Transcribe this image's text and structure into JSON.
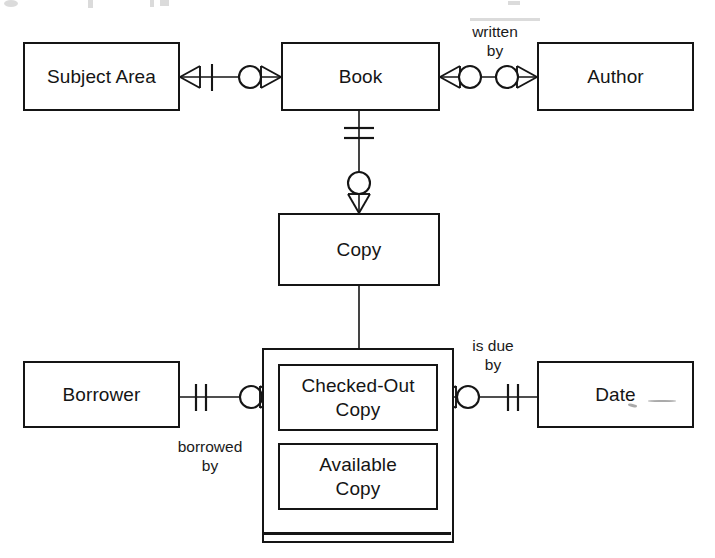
{
  "diagram": {
    "notation": "crow's-foot",
    "background_color": "#ffffff",
    "line_color": "#151515",
    "entities": [
      {
        "id": "subject-area",
        "label": "Subject Area",
        "x": 23,
        "y": 42,
        "w": 157,
        "h": 69
      },
      {
        "id": "book",
        "label": "Book",
        "x": 281,
        "y": 42,
        "w": 159,
        "h": 69
      },
      {
        "id": "author",
        "label": "Author",
        "x": 537,
        "y": 42,
        "w": 157,
        "h": 69
      },
      {
        "id": "copy",
        "label": "Copy",
        "x": 278,
        "y": 213,
        "w": 162,
        "h": 73
      },
      {
        "id": "borrower",
        "label": "Borrower",
        "x": 23,
        "y": 361,
        "w": 157,
        "h": 67
      },
      {
        "id": "date",
        "label": "Date",
        "x": 537,
        "y": 361,
        "w": 157,
        "h": 67
      },
      {
        "id": "checked-out-copy",
        "label": "Checked-Out\nCopy",
        "x": 278,
        "y": 364,
        "w": 160,
        "h": 67
      },
      {
        "id": "available-copy",
        "label": "Available\nCopy",
        "x": 278,
        "y": 443,
        "w": 160,
        "h": 67
      }
    ],
    "supertype_container": {
      "id": "copy-subtype-container",
      "x": 262,
      "y": 348,
      "w": 192,
      "h": 195,
      "subtypes": [
        "checked-out-copy",
        "available-copy"
      ]
    },
    "relationships": [
      {
        "id": "subject-area-book",
        "label": "",
        "from": "subject-area",
        "to": "book",
        "from_cardinality": "many-one",
        "to_cardinality": "zero-many"
      },
      {
        "id": "book-author",
        "label": "written\nby",
        "from": "book",
        "to": "author",
        "from_cardinality": "zero-many",
        "to_cardinality": "zero-many"
      },
      {
        "id": "book-copy",
        "label": "",
        "from": "book",
        "to": "copy",
        "from_cardinality": "one-and-only-one",
        "to_cardinality": "zero-many"
      },
      {
        "id": "copy-subtypes",
        "label": "",
        "from": "copy",
        "to": "copy-subtype-container",
        "from_cardinality": "plain",
        "to_cardinality": "plain"
      },
      {
        "id": "borrower-checked-out-copy",
        "label": "borrowed\nby",
        "from": "borrower",
        "to": "checked-out-copy",
        "from_cardinality": "one-and-only-one",
        "to_cardinality": "zero-many"
      },
      {
        "id": "checked-out-copy-date",
        "label": "is due\nby",
        "from": "checked-out-copy",
        "to": "date",
        "from_cardinality": "zero-many",
        "to_cardinality": "one-and-only-one"
      }
    ],
    "labels": {
      "written_by": "written\nby",
      "borrowed_by": "borrowed\nby",
      "is_due_by": "is due\nby"
    }
  }
}
